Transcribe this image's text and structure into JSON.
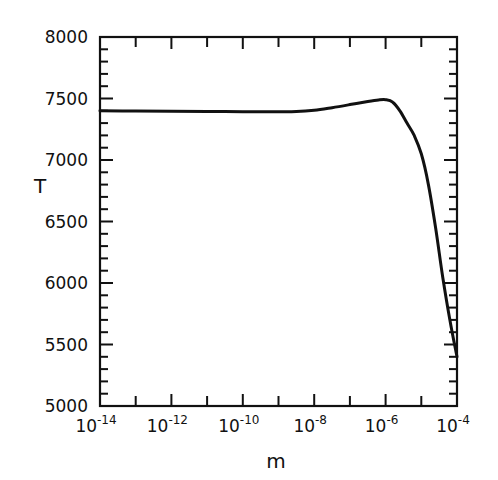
{
  "chart_data": {
    "type": "line",
    "title": "",
    "xlabel": "m",
    "ylabel": "T",
    "xscale": "log",
    "xlim": [
      1e-14,
      0.0001
    ],
    "ylim": [
      5000,
      8000
    ],
    "grid": false,
    "legend": null,
    "x_ticks": [
      "10^-14",
      "10^-12",
      "10^-10",
      "10^-8",
      "10^-6",
      "10^-4"
    ],
    "x_tick_labels": [
      {
        "base": "10",
        "exp": "-14"
      },
      {
        "base": "10",
        "exp": "-12"
      },
      {
        "base": "10",
        "exp": "-10"
      },
      {
        "base": "10",
        "exp": "-8"
      },
      {
        "base": "10",
        "exp": "-6"
      },
      {
        "base": "10",
        "exp": "-4"
      }
    ],
    "y_ticks": [
      "5000",
      "5500",
      "6000",
      "6500",
      "7000",
      "7500",
      "8000"
    ],
    "series": [
      {
        "name": "T(m)",
        "color": "#111111",
        "log10_x": [
          -14,
          -13,
          -12,
          -11,
          -10,
          -9,
          -8.5,
          -8,
          -7.5,
          -7,
          -6.5,
          -6.2,
          -6,
          -5.8,
          -5.6,
          -5.4,
          -5.2,
          -5,
          -4.8,
          -4.6,
          -4.4,
          -4.2,
          -4
        ],
        "y": [
          7400,
          7398,
          7396,
          7394,
          7393,
          7393,
          7395,
          7405,
          7425,
          7450,
          7475,
          7488,
          7490,
          7470,
          7400,
          7300,
          7200,
          7050,
          6800,
          6450,
          6050,
          5700,
          5400
        ]
      }
    ]
  }
}
